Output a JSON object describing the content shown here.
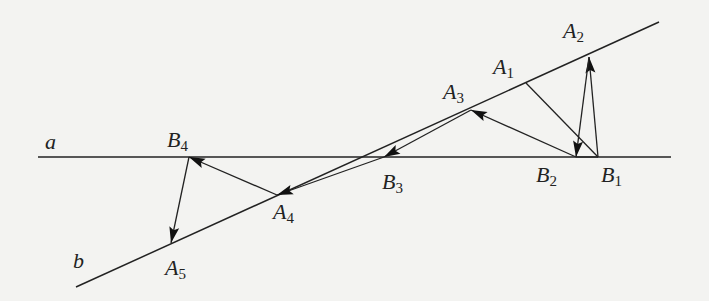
{
  "figure": {
    "background": "#f3f3f1",
    "stroke_color": "#222222",
    "lines": [
      {
        "id": "a",
        "name": "line-a",
        "from": [
          38,
          157
        ],
        "to": [
          671,
          157
        ]
      },
      {
        "id": "b",
        "name": "line-b",
        "from": [
          76,
          287
        ],
        "to": [
          659,
          22
        ]
      }
    ],
    "points": {
      "A1": [
        526,
        83
      ],
      "A2": [
        589,
        57
      ],
      "A3": [
        471,
        110
      ],
      "A4": [
        277,
        195
      ],
      "A5": [
        171,
        243
      ],
      "B1": [
        598,
        157
      ],
      "B2": [
        576,
        157
      ],
      "B3": [
        384,
        157
      ],
      "B4": [
        189,
        157
      ]
    },
    "segments": [
      {
        "name": "segment-A1-B1",
        "from": "A1",
        "to": "B1",
        "arrow": false
      },
      {
        "name": "arrow-B1-A2",
        "from": "B1",
        "to": "A2",
        "arrow": true
      },
      {
        "name": "arrow-A2-B2",
        "from": "A2",
        "to": "B2",
        "arrow": true
      },
      {
        "name": "arrow-B1-B2-head",
        "from": "B1",
        "to": "B2",
        "arrow": false
      },
      {
        "name": "arrow-B2-A3",
        "from": "B2",
        "to": "A3",
        "arrow": true
      },
      {
        "name": "arrow-A3-B3",
        "from": "A3",
        "to": "B3",
        "arrow": true
      },
      {
        "name": "arrow-B3-A4",
        "from": "B3",
        "to": "A4",
        "arrow": true
      },
      {
        "name": "arrow-A4-B4",
        "from": "A4",
        "to": "B4",
        "arrow": true
      },
      {
        "name": "arrow-B4-A5",
        "from": "B4",
        "to": "A5",
        "arrow": true
      }
    ],
    "labels": [
      {
        "name": "label-line-a",
        "letter": "a",
        "sub": "",
        "x": 45,
        "y": 131
      },
      {
        "name": "label-line-b",
        "letter": "b",
        "sub": "",
        "x": 73,
        "y": 250
      },
      {
        "name": "label-A1",
        "letter": "A",
        "sub": "1",
        "x": 493,
        "y": 56
      },
      {
        "name": "label-A2",
        "letter": "A",
        "sub": "2",
        "x": 563,
        "y": 20
      },
      {
        "name": "label-A3",
        "letter": "A",
        "sub": "3",
        "x": 443,
        "y": 81
      },
      {
        "name": "label-A4",
        "letter": "A",
        "sub": "4",
        "x": 273,
        "y": 201
      },
      {
        "name": "label-A5",
        "letter": "A",
        "sub": "5",
        "x": 165,
        "y": 257
      },
      {
        "name": "label-B1",
        "letter": "B",
        "sub": "1",
        "x": 601,
        "y": 164
      },
      {
        "name": "label-B2",
        "letter": "B",
        "sub": "2",
        "x": 536,
        "y": 164
      },
      {
        "name": "label-B3",
        "letter": "B",
        "sub": "3",
        "x": 382,
        "y": 171
      },
      {
        "name": "label-B4",
        "letter": "B",
        "sub": "4",
        "x": 167,
        "y": 129
      }
    ]
  }
}
